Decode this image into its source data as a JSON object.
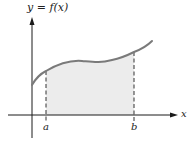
{
  "diagram": {
    "title": "y = f(x)",
    "x_axis_label": "x",
    "lower_bound_label": "a",
    "upper_bound_label": "b"
  },
  "colors": {
    "curve": "#7a7a7a",
    "area_fill": "#ececec",
    "axes": "#1a1a1a",
    "bound_lines": "#333333"
  }
}
